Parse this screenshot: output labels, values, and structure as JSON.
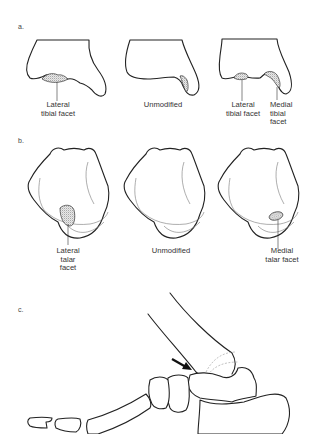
{
  "figure": {
    "panels": [
      {
        "label": "a.",
        "subject": "distal tibia",
        "captions": [
          {
            "text": "Lateral\ntibial facet"
          },
          {
            "text": "Unmodified"
          },
          {
            "text": "Lateral\ntibial facet"
          },
          {
            "text": "Medial\ntibial\nfacet"
          }
        ]
      },
      {
        "label": "b.",
        "subject": "talus",
        "captions": [
          {
            "text": "Lateral\ntalar\nfacet"
          },
          {
            "text": "Unmodified"
          },
          {
            "text": "Medial\ntalar facet"
          }
        ]
      },
      {
        "label": "c.",
        "subject": "foot lateral view with arrow",
        "arrow": "arrow-pointing-to-ankle-joint"
      }
    ]
  }
}
